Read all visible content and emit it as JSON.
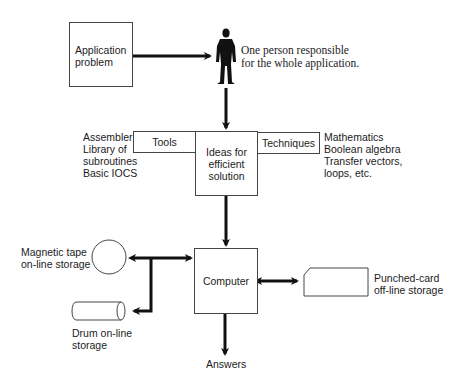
{
  "diagram": {
    "nodes": {
      "application_problem": {
        "line1": "Application",
        "line2": "problem"
      },
      "person_caption": {
        "line1": "One person responsible",
        "line2": "for the whole application."
      },
      "tools": {
        "label": "Tools"
      },
      "ideas": {
        "line1": "Ideas for",
        "line2": "efficient",
        "line3": "solution"
      },
      "techniques": {
        "label": "Techniques"
      },
      "computer": {
        "label": "Computer"
      },
      "answers": {
        "label": "Answers"
      }
    },
    "tools_list": [
      "Assembler",
      "Library of",
      "subroutines",
      "Basic IOCS"
    ],
    "techniques_list": [
      "Mathematics",
      "Boolean algebra",
      "Transfer vectors,",
      "loops, etc."
    ],
    "storage": {
      "magnetic_tape": {
        "line1": "Magnetic tape",
        "line2": "on-line storage"
      },
      "drum": {
        "line1": "Drum on-line",
        "line2": "storage"
      },
      "punched_card": {
        "line1": "Punched-card",
        "line2": "off-line storage"
      }
    },
    "colors": {
      "line": "#111111",
      "box_border": "#444444",
      "figure": "#111111"
    }
  }
}
